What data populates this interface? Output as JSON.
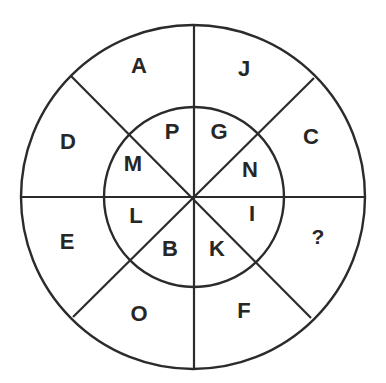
{
  "diagram": {
    "type": "letter-wheel-puzzle",
    "outer_ring": {
      "segments": [
        {
          "position": "top-left",
          "label": "A"
        },
        {
          "position": "top-right",
          "label": "J"
        },
        {
          "position": "right-top",
          "label": "C"
        },
        {
          "position": "right-bottom",
          "label": "?"
        },
        {
          "position": "bottom-right",
          "label": "F"
        },
        {
          "position": "bottom-left",
          "label": "O"
        },
        {
          "position": "left-bottom",
          "label": "E"
        },
        {
          "position": "left-top",
          "label": "D"
        }
      ]
    },
    "inner_ring": {
      "segments": [
        {
          "position": "top-left",
          "label": "P"
        },
        {
          "position": "top-right",
          "label": "G"
        },
        {
          "position": "right-top",
          "label": "N"
        },
        {
          "position": "right-bottom",
          "label": "I"
        },
        {
          "position": "bottom-right",
          "label": "K"
        },
        {
          "position": "bottom-left",
          "label": "B"
        },
        {
          "position": "left-bottom",
          "label": "L"
        },
        {
          "position": "left-top",
          "label": "M"
        }
      ]
    },
    "colors": {
      "line": "#2b2b2b",
      "text": "#262626",
      "background": "#ffffff"
    }
  }
}
